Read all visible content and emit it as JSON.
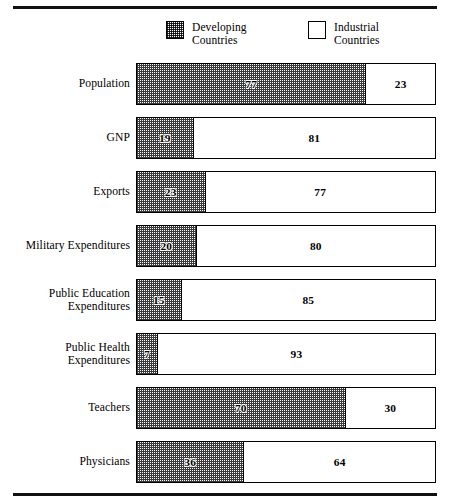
{
  "legend": {
    "items": [
      {
        "label": "Developing\nCountries",
        "swatch": "dotted-swatch-icon"
      },
      {
        "label": "Industrial\nCountries",
        "swatch": "plain-swatch-icon"
      }
    ]
  },
  "chart_data": {
    "type": "bar",
    "title": "",
    "subtitle": "",
    "xlabel": "",
    "ylabel": "",
    "orientation": "horizontal",
    "stacked": true,
    "normalized": true,
    "xlim": [
      0,
      100
    ],
    "grid": false,
    "legend_position": "top-center",
    "units": "percent",
    "categories": [
      "Population",
      "GNP",
      "Exports",
      "Military Expenditures",
      "Public Education\nExpenditures",
      "Public Health\nExpenditures",
      "Teachers",
      "Physicians"
    ],
    "series": [
      {
        "name": "Developing Countries",
        "fill": "dotted",
        "values": [
          77,
          19,
          23,
          20,
          15,
          7,
          70,
          36
        ]
      },
      {
        "name": "Industrial Countries",
        "fill": "white",
        "values": [
          23,
          81,
          77,
          80,
          85,
          93,
          30,
          64
        ]
      }
    ],
    "colors": {
      "outline": "#000000",
      "developing_pattern": "#3a3a3a",
      "industrial_fill": "#ffffff",
      "rule": "#111111"
    }
  }
}
